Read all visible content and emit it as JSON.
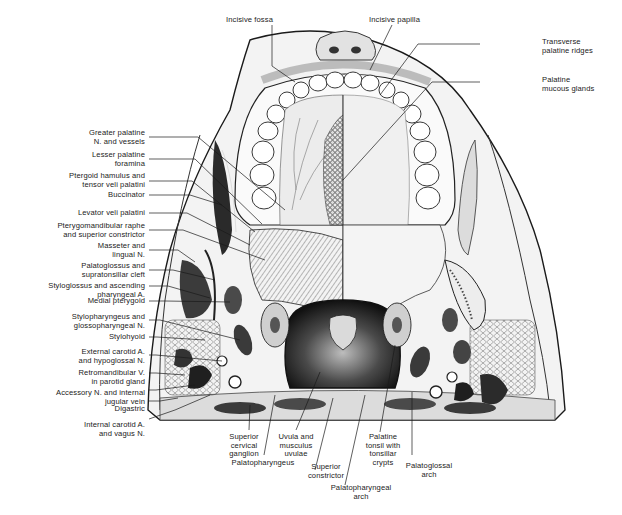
{
  "figure": {
    "labels_top": [
      {
        "id": "incisive-fossa",
        "text": "Incisive fossa"
      },
      {
        "id": "incisive-papilla",
        "text": "Incisive papilla"
      }
    ],
    "labels_right": [
      {
        "id": "transverse-palatine-ridges",
        "text": "Transverse\npalatine ridges"
      },
      {
        "id": "palatine-mucous-glands",
        "text": "Palatine\nmucous glands"
      }
    ],
    "labels_left": [
      {
        "id": "greater-palatine",
        "text": "Greater palatine\nN. and vessels"
      },
      {
        "id": "lesser-palatine-foramina",
        "text": "Lesser palatine\nforamina"
      },
      {
        "id": "ptergoid-hamulus",
        "text": "Ptergoid hamulus and\ntensor veli palatini"
      },
      {
        "id": "buccinator",
        "text": "Buccinator"
      },
      {
        "id": "levator-veli-palatini",
        "text": "Levator veli palatini"
      },
      {
        "id": "pterygomandibular-raphe",
        "text": "Pterygomandibular raphe\nand superior constrictor"
      },
      {
        "id": "masseter-lingual",
        "text": "Masseter and\nlingual N."
      },
      {
        "id": "palatoglossus",
        "text": "Palatoglossus and\nsupratonsillar cleft"
      },
      {
        "id": "styloglossus",
        "text": "Styloglossus and ascending\npharyngeal A."
      },
      {
        "id": "medial-pterygoid",
        "text": "Medial pterygoid"
      },
      {
        "id": "stylopharyngeus",
        "text": "Stylopharyngeus and\nglossopharyngeal N."
      },
      {
        "id": "stylohyoid",
        "text": "Stylohyoid"
      },
      {
        "id": "external-carotid",
        "text": "External carotid A.\nand hypoglossal N."
      },
      {
        "id": "retromandibular-v",
        "text": "Retromandibular V.\nin parotid gland"
      },
      {
        "id": "accessory-n",
        "text": "Accessory N. and internal\njugular vein"
      },
      {
        "id": "digastric",
        "text": "Digastric"
      },
      {
        "id": "internal-carotid",
        "text": "Internal carotid A.\nand vagus N."
      }
    ],
    "labels_bottom": [
      {
        "id": "superior-cervical-ganglion",
        "text": "Superior\ncervical\nganglion"
      },
      {
        "id": "palatopharyngeus",
        "text": "Palatopharyngeus"
      },
      {
        "id": "uvula",
        "text": "Uvula and\nmusculus\nuvulae"
      },
      {
        "id": "superior-constrictor",
        "text": "Superior\nconstrictor"
      },
      {
        "id": "palatopharyngeal-arch",
        "text": "Palatopharyngeal\narch"
      },
      {
        "id": "palatine-tonsil",
        "text": "Palatine\ntonsil with\ntonsillar\ncrypts"
      },
      {
        "id": "palatoglossal-arch",
        "text": "Palatoglossal\narch"
      }
    ],
    "colors": {
      "ink": "#1a1a1a",
      "tissue_light": "#e9e9e9",
      "tissue_mid": "#9a9a9a",
      "tissue_dark": "#2b2b2b",
      "background": "#ffffff"
    }
  }
}
